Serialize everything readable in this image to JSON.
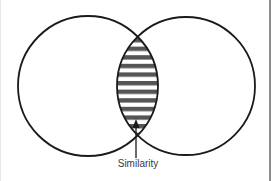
{
  "diagram": {
    "type": "venn",
    "sets": [
      {
        "id": "left",
        "cx": 88,
        "cy": 86,
        "r": 70
      },
      {
        "id": "right",
        "cx": 186,
        "cy": 86,
        "r": 69
      }
    ],
    "intersection": {
      "fill_pattern": "horizontal-stripes",
      "stripe_color": "#555555",
      "stripe_count": 11
    },
    "annotation": {
      "label": "Similarity",
      "arrow_direction": "up"
    },
    "colors": {
      "stroke": "#1a1a1a",
      "stripe": "#555555",
      "label": "#3a3a3a",
      "background": "#ffffff"
    }
  }
}
